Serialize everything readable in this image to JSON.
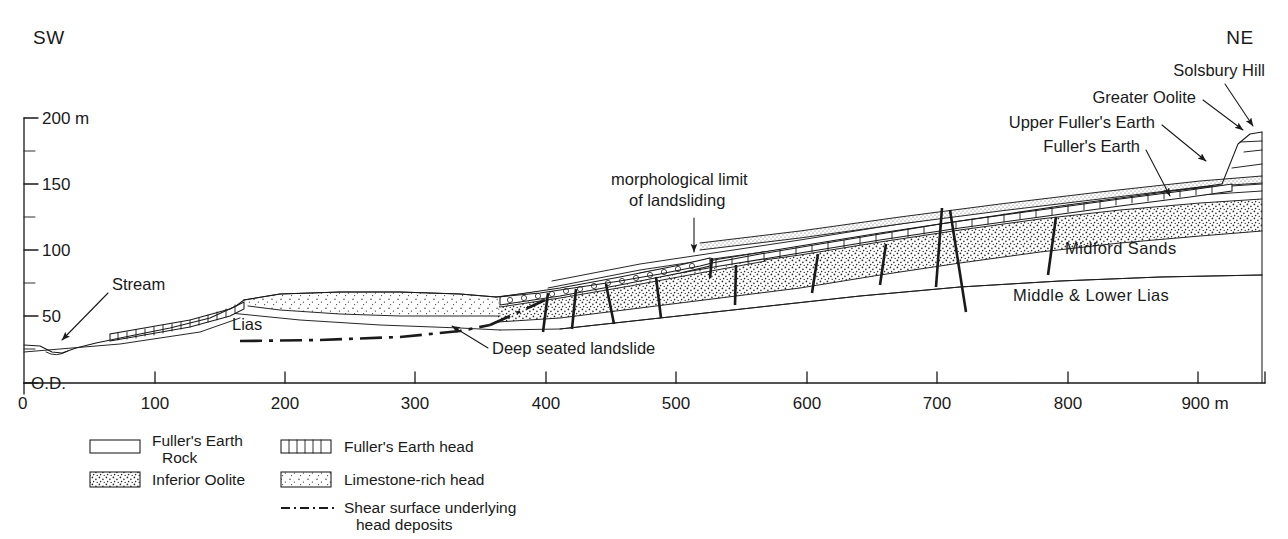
{
  "figure": {
    "compass_left": "SW",
    "compass_right": "NE"
  },
  "axes": {
    "y_axis": {
      "unit_label": "200 m",
      "datum_label": "O.D.",
      "labels": [
        "200 m",
        "150",
        "100",
        "50",
        "O.D."
      ],
      "major_values": [
        200,
        150,
        100,
        50,
        0
      ],
      "minor_values": [
        175,
        125,
        75,
        25
      ],
      "min": 0,
      "max": 200
    },
    "x_axis": {
      "labels": [
        "0",
        "100",
        "200",
        "300",
        "400",
        "500",
        "600",
        "700",
        "800",
        "900 m"
      ],
      "values": [
        0,
        100,
        200,
        300,
        400,
        500,
        600,
        700,
        800,
        900
      ],
      "min": 0,
      "max": 950,
      "unit": "m"
    }
  },
  "annotations": [
    {
      "id": "stream",
      "text": "Stream"
    },
    {
      "id": "lias",
      "text": "Lias"
    },
    {
      "id": "deep-seated-landslide",
      "text": "Deep seated landslide"
    },
    {
      "id": "morphological-limit-1",
      "text": "morphological limit"
    },
    {
      "id": "morphological-limit-2",
      "text": "of landsliding"
    },
    {
      "id": "solsbury-hill",
      "text": "Solsbury Hill"
    },
    {
      "id": "greater-oolite",
      "text": "Greater Oolite"
    },
    {
      "id": "upper-fullers-earth",
      "text": "Upper Fuller's Earth"
    },
    {
      "id": "fullers-earth",
      "text": "Fuller's Earth"
    },
    {
      "id": "midford-sands",
      "text": "Midford Sands"
    },
    {
      "id": "middle-lower-lias",
      "text": "Middle & Lower Lias"
    }
  ],
  "legend": {
    "items": [
      {
        "id": "fullers-earth-rock",
        "label_line1": "Fuller's Earth",
        "label_line2": "Rock",
        "swatch": "plain-box"
      },
      {
        "id": "inferior-oolite",
        "label_line1": "Inferior Oolite",
        "label_line2": "",
        "swatch": "dense-stipple-box"
      },
      {
        "id": "fullers-earth-head",
        "label_line1": "Fuller's Earth head",
        "label_line2": "",
        "swatch": "segmented-box"
      },
      {
        "id": "limestone-rich-head",
        "label_line1": "Limestone-rich head",
        "label_line2": "",
        "swatch": "sparse-stipple-box"
      },
      {
        "id": "shear-surface",
        "label_line1": "Shear surface underlying",
        "label_line2": "head deposits",
        "swatch": "dash-dot-line"
      }
    ]
  },
  "colors": {
    "ink": "#1a1a1a",
    "paper": "#ffffff",
    "stipple": "#3a3a3a"
  }
}
